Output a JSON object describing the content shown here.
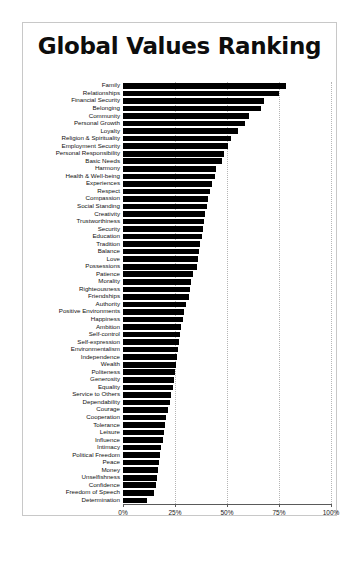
{
  "chart": {
    "title": "Global Values Ranking",
    "xlabel": "",
    "ylabel": ""
  },
  "axis": {
    "ticks": [
      "0%",
      "25%",
      "50%",
      "75%",
      "100%"
    ]
  },
  "chart_data": {
    "type": "bar",
    "orientation": "horizontal",
    "title": "Global Values Ranking",
    "xlabel": "",
    "ylabel": "",
    "xlim": [
      0,
      100
    ],
    "xticks": [
      0,
      25,
      50,
      75,
      100
    ],
    "xtick_labels": [
      "0%",
      "25%",
      "50%",
      "75%",
      "100%"
    ],
    "grid": true,
    "legend": false,
    "bar_color": "#000000",
    "categories": [
      "Family",
      "Relationships",
      "Financial Security",
      "Belonging",
      "Community",
      "Personal Growth",
      "Loyalty",
      "Religion & Spirituality",
      "Employment Security",
      "Personal Responsibility",
      "Basic Needs",
      "Harmony",
      "Health & Well-being",
      "Experiences",
      "Respect",
      "Compassion",
      "Social Standing",
      "Creativity",
      "Trustworthiness",
      "Security",
      "Education",
      "Tradition",
      "Balance",
      "Love",
      "Possessions",
      "Patience",
      "Morality",
      "Righteousness",
      "Friendships",
      "Authority",
      "Positive Environments",
      "Happiness",
      "Ambition",
      "Self-control",
      "Self-expression",
      "Environmentalism",
      "Independence",
      "Wealth",
      "Politeness",
      "Generosity",
      "Equality",
      "Service to Others",
      "Dependability",
      "Courage",
      "Cooperation",
      "Tolerance",
      "Leisure",
      "Influence",
      "Intimacy",
      "Political Freedom",
      "Peace",
      "Money",
      "Unselfishness",
      "Confidence",
      "Freedom of Speech",
      "Determination"
    ],
    "values": [
      78.5,
      75.0,
      68.0,
      66.5,
      60.5,
      58.5,
      55.5,
      52.0,
      50.5,
      48.5,
      47.5,
      44.5,
      44.0,
      43.0,
      42.0,
      41.0,
      40.5,
      39.5,
      39.0,
      38.5,
      38.0,
      37.0,
      36.5,
      36.0,
      35.5,
      33.5,
      32.5,
      32.0,
      31.5,
      30.5,
      29.5,
      29.0,
      28.0,
      27.5,
      27.0,
      26.5,
      26.0,
      25.5,
      25.0,
      24.5,
      24.0,
      23.0,
      22.5,
      21.5,
      20.5,
      20.0,
      19.5,
      19.0,
      18.5,
      18.0,
      17.5,
      17.0,
      16.5,
      16.0,
      15.0,
      11.5
    ]
  }
}
